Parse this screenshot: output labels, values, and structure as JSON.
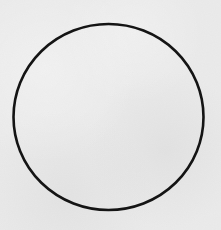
{
  "figure": {
    "background_color": "#ebebeb",
    "shapes": [
      {
        "type": "circle",
        "cx": 108.5,
        "cy": 117,
        "rx": 95,
        "ry": 93,
        "stroke": "#141414",
        "stroke_width": 2.6,
        "fill": "none"
      }
    ]
  }
}
